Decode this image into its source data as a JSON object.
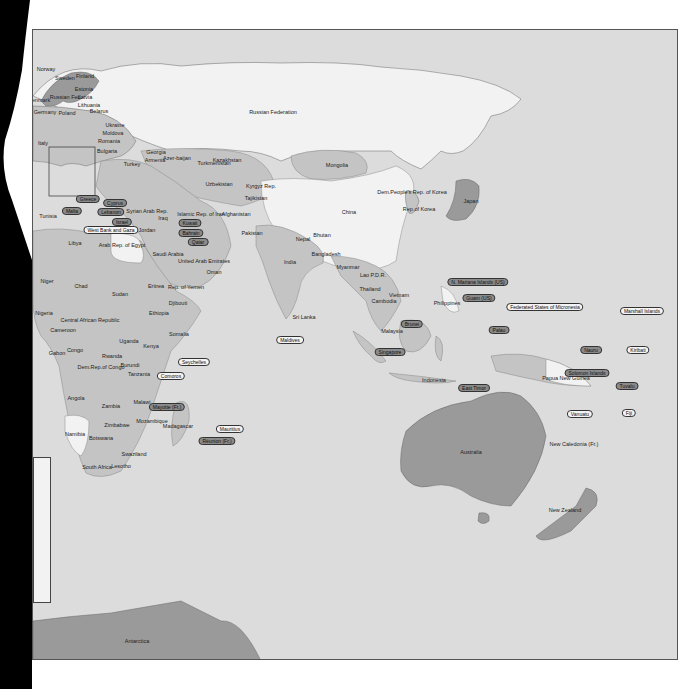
{
  "map": {
    "title": "World political map (Eastern Hemisphere)",
    "colors": {
      "ocean": "#dcdcdc",
      "land_light": "#f2f2f2",
      "land_mid": "#c4c4c4",
      "land_dark": "#9a9a9a",
      "border": "#555555",
      "tag_dark": "#8a8a8a",
      "tag_light": "#f4f4f4"
    },
    "country_labels": [
      {
        "text": "Norway",
        "x": 45,
        "y": 68
      },
      {
        "text": "Sweden",
        "x": 64,
        "y": 77
      },
      {
        "text": "Finland",
        "x": 84,
        "y": 75
      },
      {
        "text": "Estonia",
        "x": 83,
        "y": 88
      },
      {
        "text": "Russian Fed.",
        "x": 65,
        "y": 96
      },
      {
        "text": "Latvia",
        "x": 84,
        "y": 96
      },
      {
        "text": "Lithuania",
        "x": 88,
        "y": 104
      },
      {
        "text": "Denmark",
        "x": 38,
        "y": 99
      },
      {
        "text": "Germany",
        "x": 44,
        "y": 111
      },
      {
        "text": "Poland",
        "x": 66,
        "y": 112
      },
      {
        "text": "Belarus",
        "x": 98,
        "y": 110
      },
      {
        "text": "Ukraine",
        "x": 114,
        "y": 124
      },
      {
        "text": "Moldova",
        "x": 112,
        "y": 132
      },
      {
        "text": "Romania",
        "x": 108,
        "y": 140
      },
      {
        "text": "Bulgaria",
        "x": 106,
        "y": 150
      },
      {
        "text": "Italy",
        "x": 42,
        "y": 142
      },
      {
        "text": "Turkey",
        "x": 131,
        "y": 163
      },
      {
        "text": "Georgia",
        "x": 155,
        "y": 151
      },
      {
        "text": "Armenia",
        "x": 154,
        "y": 159
      },
      {
        "text": "Azer-baijan",
        "x": 176,
        "y": 157
      },
      {
        "text": "Turkmenistan",
        "x": 213,
        "y": 162
      },
      {
        "text": "Uzbekistan",
        "x": 218,
        "y": 183
      },
      {
        "text": "Kazakhstan",
        "x": 226,
        "y": 159
      },
      {
        "text": "Kyrgyz Rep.",
        "x": 260,
        "y": 185
      },
      {
        "text": "Tajikistan",
        "x": 255,
        "y": 197
      },
      {
        "text": "Russian Federation",
        "x": 272,
        "y": 111
      },
      {
        "text": "Mongolia",
        "x": 336,
        "y": 164
      },
      {
        "text": "China",
        "x": 348,
        "y": 211
      },
      {
        "text": "Dem.People's Rep. of Korea",
        "x": 411,
        "y": 191
      },
      {
        "text": "Rep.of Korea",
        "x": 418,
        "y": 208
      },
      {
        "text": "Japan",
        "x": 470,
        "y": 200
      },
      {
        "text": "Tunisia",
        "x": 47,
        "y": 215
      },
      {
        "text": "Syrian Arab Rep.",
        "x": 146,
        "y": 210
      },
      {
        "text": "Iraq",
        "x": 162,
        "y": 217
      },
      {
        "text": "Islamic Rep. of Iran",
        "x": 200,
        "y": 213
      },
      {
        "text": "Afghanistan",
        "x": 235,
        "y": 213
      },
      {
        "text": "Pakistan",
        "x": 251,
        "y": 232
      },
      {
        "text": "Nepal",
        "x": 302,
        "y": 238
      },
      {
        "text": "Bhutan",
        "x": 321,
        "y": 234
      },
      {
        "text": "Bangladesh",
        "x": 325,
        "y": 253
      },
      {
        "text": "India",
        "x": 289,
        "y": 261
      },
      {
        "text": "Myanmar",
        "x": 347,
        "y": 266
      },
      {
        "text": "Lao P.D.R.",
        "x": 372,
        "y": 274
      },
      {
        "text": "Thailand",
        "x": 369,
        "y": 288
      },
      {
        "text": "Vietnam",
        "x": 398,
        "y": 294
      },
      {
        "text": "Cambodia",
        "x": 383,
        "y": 300
      },
      {
        "text": "Philippines",
        "x": 446,
        "y": 302
      },
      {
        "text": "Malaysia",
        "x": 391,
        "y": 330
      },
      {
        "text": "Indonesia",
        "x": 433,
        "y": 379
      },
      {
        "text": "Sri Lanka",
        "x": 303,
        "y": 316
      },
      {
        "text": "Jordan",
        "x": 146,
        "y": 229
      },
      {
        "text": "Libya",
        "x": 74,
        "y": 242
      },
      {
        "text": "Arab Rep. of Egypt",
        "x": 121,
        "y": 244
      },
      {
        "text": "Saudi Arabia",
        "x": 167,
        "y": 253
      },
      {
        "text": "United Arab Emirates",
        "x": 203,
        "y": 260
      },
      {
        "text": "Oman",
        "x": 213,
        "y": 271
      },
      {
        "text": "Niger",
        "x": 46,
        "y": 280
      },
      {
        "text": "Chad",
        "x": 80,
        "y": 285
      },
      {
        "text": "Sudan",
        "x": 119,
        "y": 293
      },
      {
        "text": "Eritrea",
        "x": 155,
        "y": 285
      },
      {
        "text": "Rep. of Yemen",
        "x": 185,
        "y": 286
      },
      {
        "text": "Djibouti",
        "x": 177,
        "y": 302
      },
      {
        "text": "Ethiopia",
        "x": 158,
        "y": 312
      },
      {
        "text": "Somalia",
        "x": 178,
        "y": 333
      },
      {
        "text": "Nigeria",
        "x": 43,
        "y": 312
      },
      {
        "text": "Central African Republic",
        "x": 89,
        "y": 319
      },
      {
        "text": "Cameroon",
        "x": 62,
        "y": 329
      },
      {
        "text": "Gabon",
        "x": 56,
        "y": 352
      },
      {
        "text": "Congo",
        "x": 74,
        "y": 349
      },
      {
        "text": "Uganda",
        "x": 128,
        "y": 340
      },
      {
        "text": "Kenya",
        "x": 150,
        "y": 345
      },
      {
        "text": "Rwanda",
        "x": 111,
        "y": 355
      },
      {
        "text": "Dem.Rep.of Congo",
        "x": 100,
        "y": 366
      },
      {
        "text": "Burundi",
        "x": 129,
        "y": 364
      },
      {
        "text": "Tanzania",
        "x": 138,
        "y": 373
      },
      {
        "text": "Angola",
        "x": 75,
        "y": 397
      },
      {
        "text": "Zambia",
        "x": 110,
        "y": 405
      },
      {
        "text": "Malawi",
        "x": 141,
        "y": 401
      },
      {
        "text": "Zimbabwe",
        "x": 116,
        "y": 424
      },
      {
        "text": "Mozambique",
        "x": 151,
        "y": 420
      },
      {
        "text": "Madagascar",
        "x": 177,
        "y": 425
      },
      {
        "text": "Namibia",
        "x": 74,
        "y": 433
      },
      {
        "text": "Botswana",
        "x": 100,
        "y": 437
      },
      {
        "text": "Swaziland",
        "x": 133,
        "y": 453
      },
      {
        "text": "South Africa",
        "x": 96,
        "y": 466
      },
      {
        "text": "Lesotho",
        "x": 120,
        "y": 465
      },
      {
        "text": "Papua New Guinea",
        "x": 565,
        "y": 377
      },
      {
        "text": "Australia",
        "x": 470,
        "y": 451
      },
      {
        "text": "New Caledonia (Fr.)",
        "x": 573,
        "y": 443
      },
      {
        "text": "New Zealand",
        "x": 564,
        "y": 509
      },
      {
        "text": "Antarctica",
        "x": 136,
        "y": 640
      }
    ],
    "callout_tags": [
      {
        "text": "Malta",
        "x": 71,
        "y": 210,
        "style": "dark"
      },
      {
        "text": "Greece",
        "x": 87,
        "y": 198,
        "style": "dark"
      },
      {
        "text": "Cyprus",
        "x": 114,
        "y": 202,
        "style": "dark"
      },
      {
        "text": "Lebanon",
        "x": 110,
        "y": 211,
        "style": "dark"
      },
      {
        "text": "Israel",
        "x": 121,
        "y": 221,
        "style": "dark"
      },
      {
        "text": "West Bank and Gaza",
        "x": 110,
        "y": 229,
        "style": "light"
      },
      {
        "text": "Kuwait",
        "x": 189,
        "y": 222,
        "style": "dark"
      },
      {
        "text": "Bahrain",
        "x": 190,
        "y": 232,
        "style": "dark"
      },
      {
        "text": "Qatar",
        "x": 197,
        "y": 241,
        "style": "dark"
      },
      {
        "text": "N. Mariana Islands (US)",
        "x": 477,
        "y": 281,
        "style": "dark"
      },
      {
        "text": "Guam (US)",
        "x": 478,
        "y": 297,
        "style": "dark"
      },
      {
        "text": "Federated States of Micronesia",
        "x": 544,
        "y": 306,
        "style": "light"
      },
      {
        "text": "Marshall Islands",
        "x": 641,
        "y": 310,
        "style": "light"
      },
      {
        "text": "Palau",
        "x": 498,
        "y": 329,
        "style": "dark"
      },
      {
        "text": "Nauru",
        "x": 590,
        "y": 349,
        "style": "dark"
      },
      {
        "text": "Kiribati",
        "x": 637,
        "y": 349,
        "style": "light"
      },
      {
        "text": "Solomon Islands",
        "x": 586,
        "y": 372,
        "style": "dark"
      },
      {
        "text": "Tuvalu",
        "x": 626,
        "y": 385,
        "style": "dark"
      },
      {
        "text": "Vanuatu",
        "x": 579,
        "y": 413,
        "style": "light"
      },
      {
        "text": "Fiji",
        "x": 628,
        "y": 412,
        "style": "light"
      },
      {
        "text": "Brunei",
        "x": 411,
        "y": 323,
        "style": "dark"
      },
      {
        "text": "Singapore",
        "x": 389,
        "y": 351,
        "style": "dark"
      },
      {
        "text": "East Timor",
        "x": 473,
        "y": 387,
        "style": "dark"
      },
      {
        "text": "Maldives",
        "x": 289,
        "y": 339,
        "style": "light"
      },
      {
        "text": "Seychelles",
        "x": 193,
        "y": 361,
        "style": "light"
      },
      {
        "text": "Comoros",
        "x": 170,
        "y": 375,
        "style": "light"
      },
      {
        "text": "Mayotte (Fr.)",
        "x": 166,
        "y": 406,
        "style": "dark"
      },
      {
        "text": "Mauritius",
        "x": 229,
        "y": 428,
        "style": "light"
      },
      {
        "text": "Réunion (Fr.)",
        "x": 216,
        "y": 440,
        "style": "dark"
      }
    ],
    "insets": [
      {
        "name": "europe-detail-box",
        "x": 48,
        "y": 146,
        "w": 46,
        "h": 49
      },
      {
        "name": "caribbean-inset",
        "x": 32,
        "y": 456,
        "w": 16,
        "h": 144
      }
    ],
    "inset_labels": [
      {
        "text": "Ukraine",
        "x": 40,
        "y": 477
      },
      {
        "text": "Romania",
        "x": 40,
        "y": 515
      },
      {
        "text": "Bulgaria",
        "x": 40,
        "y": 550
      }
    ]
  }
}
